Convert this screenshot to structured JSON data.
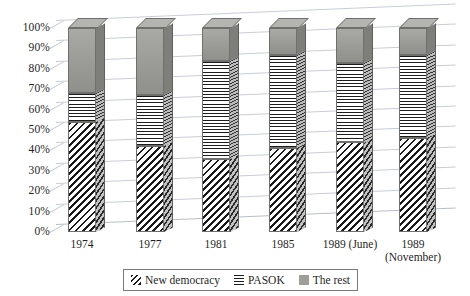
{
  "chart_data": {
    "type": "bar",
    "stacked": true,
    "stacked_normalized": true,
    "title": "",
    "xlabel": "",
    "ylabel": "",
    "ylim": [
      0,
      100
    ],
    "ytick_labels": [
      "100%",
      "90%",
      "80%",
      "70%",
      "60%",
      "50%",
      "40%",
      "30%",
      "20%",
      "10%",
      "0%"
    ],
    "ytick_values": [
      100,
      90,
      80,
      70,
      60,
      50,
      40,
      30,
      20,
      10,
      0
    ],
    "grid": true,
    "legend_position": "bottom",
    "categories": [
      "1974",
      "1977",
      "1981",
      "1985",
      "1989 (June)",
      "1989 (November)"
    ],
    "category_lines": [
      [
        "1974"
      ],
      [
        "1977"
      ],
      [
        "1981"
      ],
      [
        "1985"
      ],
      [
        "1989 (June)"
      ],
      [
        "1989",
        "(November)"
      ]
    ],
    "series": [
      {
        "name": "New democracy",
        "pattern": "diagonal-hatch",
        "values": [
          54,
          42,
          36,
          41,
          44,
          46
        ]
      },
      {
        "name": "PASOK",
        "pattern": "horizontal-lines",
        "values": [
          14,
          25,
          48,
          46,
          39,
          41
        ]
      },
      {
        "name": "The rest",
        "pattern": "solid-gray",
        "color": "#9d9d9a",
        "values": [
          32,
          33,
          16,
          13,
          17,
          13
        ]
      }
    ]
  },
  "legend": {
    "items": [
      {
        "label": "New democracy",
        "swatch": "nd"
      },
      {
        "label": "PASOK",
        "swatch": "pasok"
      },
      {
        "label": "The rest",
        "swatch": "rest"
      }
    ]
  },
  "colors": {
    "rest": "#9d9d9a",
    "grid": "#c9cdd4",
    "text": "#1f1f1f",
    "outline": "#6f6f6d"
  }
}
